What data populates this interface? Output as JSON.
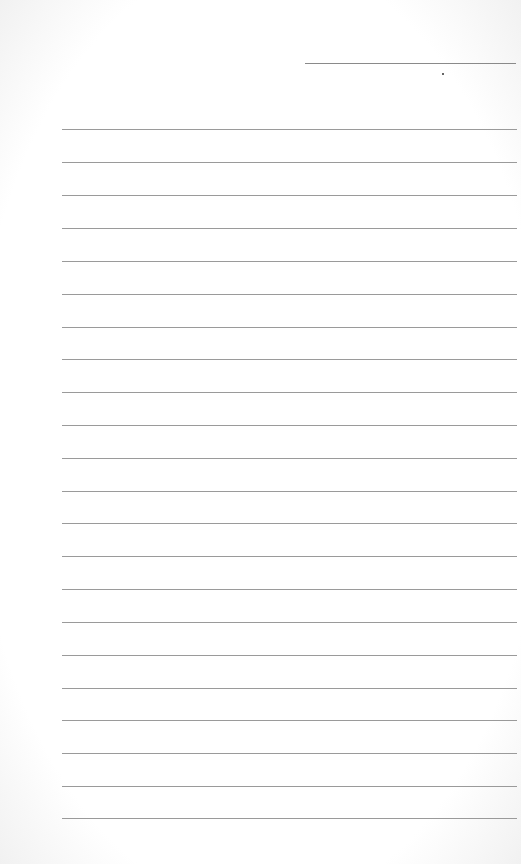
{
  "document": {
    "type": "lined-paper",
    "header_line": {
      "present": true
    },
    "dot": {
      "present": true
    },
    "rule_count": 22,
    "rule_positions": [
      129,
      162,
      195,
      228,
      261,
      294,
      327,
      359,
      392,
      425,
      458,
      491,
      523,
      556,
      589,
      622,
      655,
      688,
      720,
      753,
      786,
      818
    ],
    "colors": {
      "paper": "#ffffff",
      "rule": "#9a9a9a",
      "header_line": "#8a8a8a"
    }
  }
}
